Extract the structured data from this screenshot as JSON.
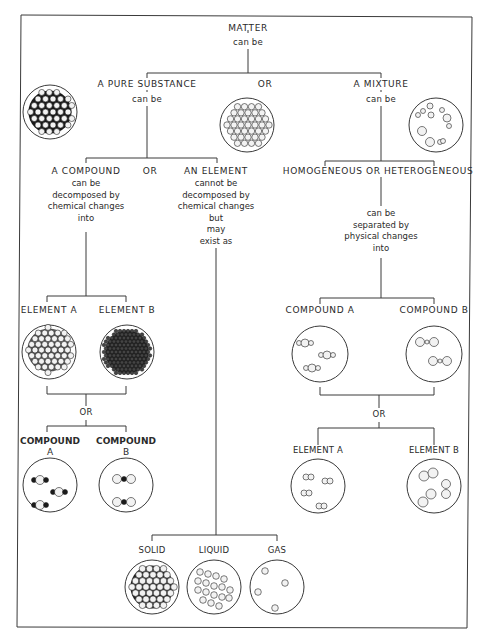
{
  "diagram": {
    "colors": {
      "line": "#3a3a3a",
      "ink": "#2a2a2a",
      "dark_atom": "#1a1a1a",
      "light_atom": "#f2f2f2"
    },
    "root": {
      "label": "MATTER",
      "connector": "can be"
    },
    "level1": {
      "or_label": "OR",
      "pure_substance": {
        "label": "A PURE SUBSTANCE",
        "connector": "can be"
      },
      "mixture": {
        "label": "A MIXTURE",
        "connector": "can be"
      }
    },
    "compound": {
      "label": "A COMPOUND",
      "lines": [
        "can be",
        "decomposed by",
        "chemical changes",
        "into"
      ]
    },
    "compound_or": "OR",
    "element": {
      "label": "AN ELEMENT",
      "lines": [
        "cannot be",
        "decomposed by",
        "chemical changes",
        "but",
        "may",
        "exist as"
      ]
    },
    "mixture_types": {
      "label": "HOMOGENEOUS OR HETEROGENEOUS",
      "lines": [
        "can be",
        "separated by",
        "physical changes",
        "into"
      ]
    },
    "compound_products": {
      "first": [
        "ELEMENT A",
        "ELEMENT B"
      ],
      "or_label": "OR",
      "second": [
        [
          "COMPOUND",
          "A"
        ],
        [
          "COMPOUND",
          "B"
        ]
      ]
    },
    "mixture_products": {
      "first": [
        "COMPOUND A",
        "COMPOUND B"
      ],
      "or_label": "OR",
      "second": [
        "ELEMENT A",
        "ELEMENT B"
      ]
    },
    "states": [
      "SOLID",
      "LIQUID",
      "GAS"
    ],
    "icons": {
      "pure_substance": "compound-lattice-icon",
      "element_lattice": "element-lattice-icon",
      "mixture": "mixture-particles-icon",
      "element_a": "element-a-lattice-icon",
      "element_b": "element-b-lattice-icon",
      "compound_a": "triatomic-molecules-icon",
      "compound_b": "diatomic-molecules-icon",
      "solid": "solid-particles-icon",
      "liquid": "liquid-particles-icon",
      "gas": "gas-particles-icon"
    }
  }
}
